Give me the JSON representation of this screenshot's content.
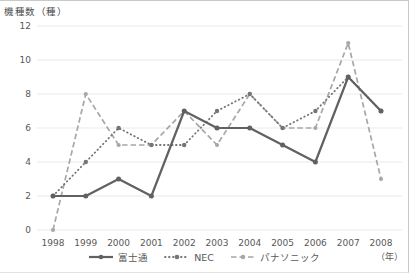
{
  "chart_data": {
    "type": "line",
    "ylabel": "機種数（種）",
    "xlabel": "（年）",
    "categories": [
      "1998",
      "1999",
      "2000",
      "2001",
      "2002",
      "2003",
      "2004",
      "2005",
      "2006",
      "2007",
      "2008"
    ],
    "series": [
      {
        "name": "富士通",
        "values": [
          2,
          2,
          3,
          2,
          7,
          6,
          6,
          5,
          4,
          9,
          7
        ],
        "color": "#616161",
        "line_style": "solid"
      },
      {
        "name": "NEC",
        "values": [
          2,
          4,
          6,
          5,
          5,
          7,
          8,
          6,
          7,
          9,
          7
        ],
        "color": "#757575",
        "line_style": "dotted"
      },
      {
        "name": "パナソニック",
        "values": [
          0,
          8,
          5,
          5,
          7,
          5,
          8,
          6,
          6,
          11,
          3
        ],
        "color": "#a7a7a7",
        "line_style": "dashed"
      }
    ],
    "ylim": [
      0,
      12
    ],
    "ytick_step": 2,
    "grid": true,
    "grid_color": "#e9e9e9",
    "tick_text_color": "#595959",
    "legend_position": "bottom"
  }
}
